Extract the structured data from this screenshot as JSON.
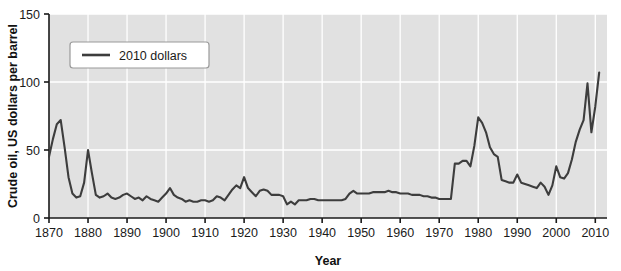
{
  "chart_data": {
    "type": "line",
    "title": "",
    "xlabel": "Year",
    "ylabel": "Crude oil, US dollars per barrel",
    "xlim": [
      1870,
      2013
    ],
    "ylim": [
      0,
      150
    ],
    "xticks": [
      1870,
      1880,
      1890,
      1900,
      1910,
      1920,
      1930,
      1940,
      1950,
      1960,
      1970,
      1980,
      1990,
      2000,
      2010
    ],
    "yticks": [
      0,
      50,
      100,
      150
    ],
    "grid": true,
    "legend_position": "upper-left",
    "series": [
      {
        "name": "2010 dollars",
        "color": "#3d3d3d",
        "x": [
          1870,
          1871,
          1872,
          1873,
          1874,
          1875,
          1876,
          1877,
          1878,
          1879,
          1880,
          1881,
          1882,
          1883,
          1884,
          1885,
          1886,
          1887,
          1888,
          1889,
          1890,
          1891,
          1892,
          1893,
          1894,
          1895,
          1896,
          1897,
          1898,
          1899,
          1900,
          1901,
          1902,
          1903,
          1904,
          1905,
          1906,
          1907,
          1908,
          1909,
          1910,
          1911,
          1912,
          1913,
          1914,
          1915,
          1916,
          1917,
          1918,
          1919,
          1920,
          1921,
          1922,
          1923,
          1924,
          1925,
          1926,
          1927,
          1928,
          1929,
          1930,
          1931,
          1932,
          1933,
          1934,
          1935,
          1936,
          1937,
          1938,
          1939,
          1940,
          1941,
          1942,
          1943,
          1944,
          1945,
          1946,
          1947,
          1948,
          1949,
          1950,
          1951,
          1952,
          1953,
          1954,
          1955,
          1956,
          1957,
          1958,
          1959,
          1960,
          1961,
          1962,
          1963,
          1964,
          1965,
          1966,
          1967,
          1968,
          1969,
          1970,
          1971,
          1972,
          1973,
          1974,
          1975,
          1976,
          1977,
          1978,
          1979,
          1980,
          1981,
          1982,
          1983,
          1984,
          1985,
          1986,
          1987,
          1988,
          1989,
          1990,
          1991,
          1992,
          1993,
          1994,
          1995,
          1996,
          1997,
          1998,
          1999,
          2000,
          2001,
          2002,
          2003,
          2004,
          2005,
          2006,
          2007,
          2008,
          2009,
          2010,
          2011
        ],
        "values": [
          45,
          58,
          69,
          72,
          52,
          30,
          18,
          15,
          16,
          26,
          50,
          33,
          17,
          15,
          16,
          18,
          15,
          14,
          15,
          17,
          18,
          16,
          14,
          15,
          13,
          16,
          14,
          13,
          12,
          15,
          18,
          22,
          17,
          15,
          14,
          12,
          13,
          12,
          12,
          13,
          13,
          12,
          13,
          16,
          15,
          13,
          17,
          21,
          24,
          22,
          30,
          22,
          19,
          16,
          20,
          21,
          20,
          17,
          17,
          17,
          16,
          10,
          12,
          10,
          13,
          13,
          13,
          14,
          14,
          13,
          13,
          13,
          13,
          13,
          13,
          13,
          14,
          18,
          20,
          18,
          18,
          18,
          18,
          19,
          19,
          19,
          19,
          20,
          19,
          19,
          18,
          18,
          18,
          17,
          17,
          17,
          16,
          16,
          15,
          15,
          14,
          14,
          14,
          14,
          40,
          40,
          42,
          42,
          38,
          53,
          74,
          70,
          63,
          52,
          47,
          45,
          28,
          27,
          26,
          26,
          32,
          26,
          25,
          24,
          23,
          22,
          26,
          23,
          17,
          24,
          38,
          30,
          29,
          33,
          43,
          56,
          65,
          72,
          99,
          63,
          82,
          107
        ]
      }
    ],
    "legend": [
      "2010 dollars"
    ]
  },
  "axes": {
    "y_title": "Crude oil, US dollars per barrel",
    "x_title": "Year",
    "y_tick_labels": [
      "0",
      "50",
      "100",
      "150"
    ],
    "x_tick_labels": [
      "1870",
      "1880",
      "1890",
      "1900",
      "1910",
      "1920",
      "1930",
      "1940",
      "1950",
      "1960",
      "1970",
      "1980",
      "1990",
      "2000",
      "2010"
    ]
  },
  "legend": {
    "entries": [
      {
        "label": "2010 dollars",
        "swatch": "line-swatch",
        "color": "#3d3d3d"
      }
    ]
  },
  "colors": {
    "plot_background": "#e1e1e1",
    "gridline": "#ffffff",
    "line": "#3d3d3d",
    "axis": "#1a1a1a",
    "page_background": "#ffffff",
    "legend_background": "#ffffff",
    "legend_border": "#9a9a9a"
  }
}
